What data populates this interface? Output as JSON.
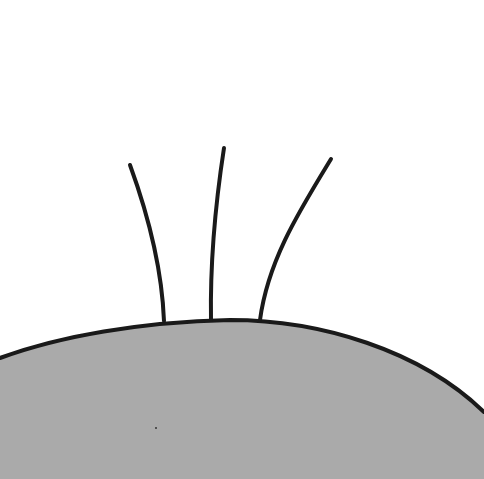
{
  "illustration": {
    "subject": "bald head with three hairs",
    "colors": {
      "background": "#ffffff",
      "head_fill": "#aaaaaa",
      "outline": "#1a1a1a"
    },
    "hair_count": 3
  }
}
